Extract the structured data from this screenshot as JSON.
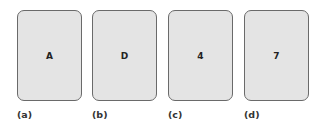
{
  "cards": [
    {
      "face": "A",
      "caption": "(a)"
    },
    {
      "face": "D",
      "caption": "(b)"
    },
    {
      "face": "4",
      "caption": "(c)"
    },
    {
      "face": "7",
      "caption": "(d)"
    }
  ],
  "colors": {
    "card_fill": "#e4e4e4",
    "card_border": "#6a6a6a",
    "text": "#222222"
  }
}
